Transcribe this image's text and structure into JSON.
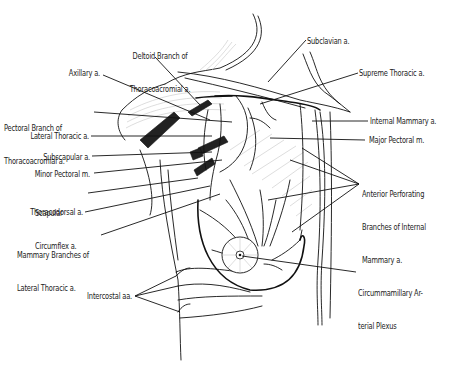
{
  "figure": {
    "type": "anatomical-line-drawing",
    "labels": {
      "deltoid_branch": [
        "Deltoid Branch of",
        "Thoracoacromial a."
      ],
      "subclavian": "Subclavian a.",
      "axillary": "Axillary a.",
      "supreme_thoracic": "Supreme Thoracic a.",
      "pectoral_branch": [
        "Pectoral Branch of",
        "Thoracoacromial a."
      ],
      "internal_mammary": "Internal Mammary a.",
      "lateral_thoracic": "Lateral Thoracic a.",
      "major_pectoral": "Major Pectoral m.",
      "subscapular": "Subscapular a.",
      "anterior_perforating": [
        "Anterior Perforating",
        "Branches of Internal",
        "Mammary a."
      ],
      "minor_pectoral": "Minor Pectoral m.",
      "scapular_circumflex": [
        "Scapular",
        "Circumflex a."
      ],
      "thoracodorsal": "Thoracodorsal a.",
      "mammary_branches": [
        "Mammary Branches of",
        "Lateral Thoracic a."
      ],
      "circummamillary": [
        "Circummamillary Ar-",
        "terial Plexus"
      ],
      "intercostal": "Intercostal aa."
    }
  }
}
